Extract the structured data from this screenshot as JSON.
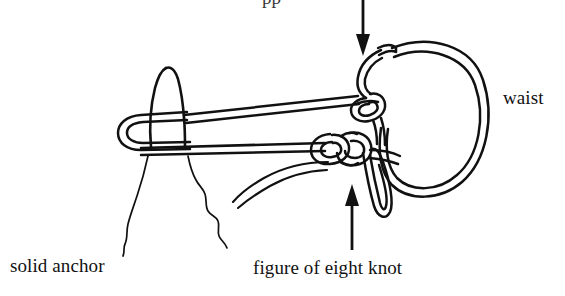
{
  "figure": {
    "kind": "line-drawing",
    "background_color": "#ffffff",
    "ink_color": "#111111",
    "width": 565,
    "height": 296
  },
  "labels": {
    "solid_anchor": "solid anchor",
    "figure_of_eight_knot": "figure of eight knot",
    "waist": "waist",
    "clipped_top": "pp"
  },
  "annotations": {
    "down_arrow": {
      "name": "arrow-down-to-waist-knot",
      "x": 363,
      "y_start": 0,
      "y_end": 54,
      "direction": "down",
      "points_to": "waist knot"
    },
    "up_arrow": {
      "name": "arrow-up-to-figure-of-eight-knot",
      "x": 352,
      "y_start": 250,
      "y_end": 185,
      "direction": "up",
      "points_to": "figure of eight knot"
    }
  },
  "parts": {
    "rock_spike": "solid anchor rock spike",
    "anchor_loop": "rope bight looped around spike",
    "upper_strand": "upper rope strand to waist knot",
    "lower_strand": "lower rope strand to figure of eight knot",
    "waist_loop": "large oval waist loop",
    "upper_knot": "knot at waist loop",
    "lower_knot": "figure of eight knot",
    "hanging_bight": "hanging rope bight below figure of eight knot",
    "rope_tail": "free rope tail curving down-left"
  }
}
